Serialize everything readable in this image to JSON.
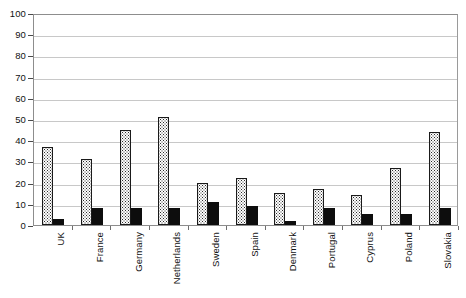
{
  "chart_data": {
    "type": "bar",
    "title": "",
    "xlabel": "",
    "ylabel": "",
    "ylim": [
      0,
      100
    ],
    "y_ticks": [
      0,
      10,
      20,
      30,
      40,
      50,
      60,
      70,
      80,
      90,
      100
    ],
    "grid": true,
    "legend": "none",
    "categories": [
      "UK",
      "France",
      "Germany",
      "Netherlands",
      "Sweden",
      "Spain",
      "Denmark",
      "Portugal",
      "Cyprus",
      "Poland",
      "Slovakia"
    ],
    "series": [
      {
        "name": "series-1",
        "style": "dotted-fill",
        "values": [
          37,
          31,
          45,
          51,
          20,
          22,
          15,
          17,
          14,
          27,
          44
        ]
      },
      {
        "name": "series-2",
        "style": "solid-black",
        "values": [
          3,
          8,
          8,
          8,
          11,
          9,
          2,
          8,
          5,
          5,
          8
        ]
      }
    ]
  }
}
